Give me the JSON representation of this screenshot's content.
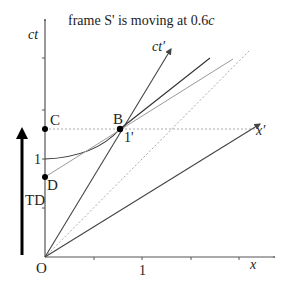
{
  "title": "frame S' is moving at 0.6c",
  "title_parts": {
    "prefix": "frame S' is moving at 0.6",
    "suffix": "c"
  },
  "axes": {
    "x_label": "x",
    "ct_label": "ct",
    "x_prime_label": "x′",
    "ct_prime_label": "ct′",
    "origin_label": "O",
    "x_tick_label": "1",
    "ct_tick_label": "1"
  },
  "points": {
    "C": "C",
    "B": "B",
    "D": "D",
    "one_prime": "1'"
  },
  "annotations": {
    "td_label": "TD"
  },
  "colors": {
    "axis": "#555555",
    "line": "#444444",
    "light_line": "#999999",
    "dotted": "#aaaaaa",
    "arrow": "#000000",
    "point": "#000000"
  }
}
